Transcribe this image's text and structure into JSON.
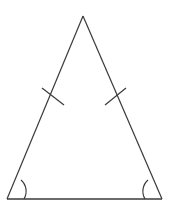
{
  "figure": {
    "kind": "geometry-diagram",
    "shape_name": "isosceles-triangle",
    "background_color": "#ffffff",
    "stroke_color": "#3a3a3a",
    "stroke_width": 1.2,
    "canvas": {
      "width": 173,
      "height": 210
    },
    "vertices": {
      "apex": {
        "label": "",
        "x": 83,
        "y": 16
      },
      "bottom_left": {
        "label": "",
        "x": 7,
        "y": 199
      },
      "bottom_right": {
        "label": "",
        "x": 162,
        "y": 199
      }
    },
    "sides": [
      {
        "name": "left-leg",
        "from": "apex",
        "to": "bottom_left",
        "path": "M 83 16 L 7 199"
      },
      {
        "name": "right-leg",
        "from": "apex",
        "to": "bottom_right",
        "path": "M 83 16 L 162 199"
      },
      {
        "name": "base",
        "from": "bottom_left",
        "to": "bottom_right",
        "path": "M 7 199 L 162 199"
      }
    ],
    "congruence_ticks": [
      {
        "name": "left-side-tick",
        "on_side": "left-leg",
        "path": "M 42 88 L 64 105"
      },
      {
        "name": "right-side-tick",
        "on_side": "right-leg",
        "path": "M 126 88 L 105 105"
      }
    ],
    "angle_arcs": [
      {
        "name": "bottom-left-angle-arc",
        "at_vertex": "bottom_left",
        "radius": 15,
        "path": "M 21 180 A 15 15 0 0 1 24 199"
      },
      {
        "name": "bottom-right-angle-arc",
        "at_vertex": "bottom_right",
        "radius": 15,
        "path": "M 145 199 A 15 15 0 0 1 148 180"
      }
    ]
  }
}
